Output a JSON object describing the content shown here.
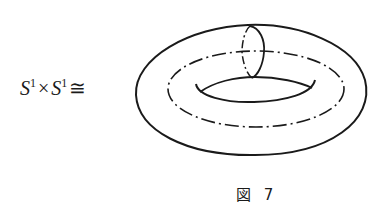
{
  "formula": {
    "left_symbol": "S",
    "left_exp": "1",
    "times": "×",
    "right_symbol": "S",
    "right_exp": "1",
    "relation": "≅"
  },
  "figure": {
    "curves": [
      "outer-contour",
      "inner-hole",
      "dash-dot-core-circle",
      "meridian-circle"
    ]
  },
  "caption": "図 7"
}
